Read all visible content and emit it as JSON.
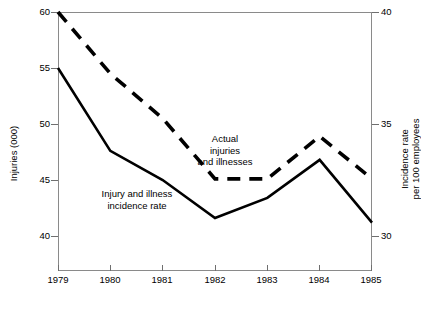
{
  "chart_data": {
    "type": "line",
    "title": "",
    "xlabel": "",
    "categories": [
      "1979",
      "1980",
      "1981",
      "1982",
      "1983",
      "1984",
      "1985"
    ],
    "grid": false,
    "legend_position": "inline-annotations",
    "axes": {
      "left": {
        "label": "Injuries (000)",
        "ticks": [
          40,
          45,
          50,
          55,
          60
        ],
        "tick_labels": [
          "40",
          "45",
          "50",
          "55",
          "60"
        ],
        "ylim": [
          36,
          60
        ]
      },
      "right": {
        "label_line1": "Incidence rate",
        "label_line2": "per 100 employees",
        "ticks": [
          30,
          35,
          40
        ],
        "tick_labels": [
          "30",
          "35",
          "40"
        ],
        "ylim": [
          28,
          40
        ]
      }
    },
    "series": [
      {
        "name": "Actual injuries and illnesses",
        "axis": "left",
        "style": "dashed",
        "annotation": "Actual\ninjuries\nand illnesses",
        "values": [
          60.0,
          54.5,
          50.5,
          45.1,
          45.1,
          48.9,
          45.1
        ]
      },
      {
        "name": "Injury and illness incidence rate",
        "axis": "right",
        "style": "solid",
        "annotation": "Injury and illness\nincidence rate",
        "values": [
          37.5,
          33.8,
          32.5,
          30.8,
          31.7,
          33.4,
          30.6
        ]
      }
    ]
  },
  "colors": {
    "line": "#000000",
    "frame": "#8a8a8a",
    "background": "#ffffff"
  }
}
